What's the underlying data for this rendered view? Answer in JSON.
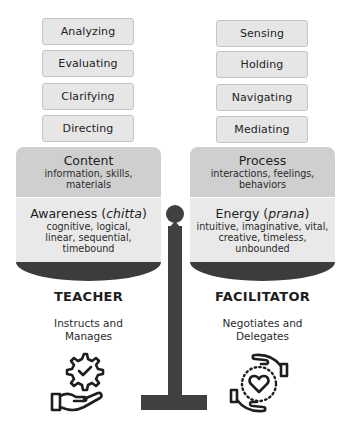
{
  "left": {
    "steps": [
      "Analyzing",
      "Evaluating",
      "Clarifying",
      "Directing"
    ],
    "upper_panel": {
      "title": "Content",
      "desc": "information, skills, materials"
    },
    "lower_panel": {
      "title_main": "Awareness (",
      "title_italic": "chitta",
      "title_end": ")",
      "desc": "cognitive, logical, linear, sequential, timebound"
    },
    "role": {
      "title": "TEACHER",
      "subtitle_line1": "Instructs and",
      "subtitle_line2": "Manages",
      "icon": "hand-gear-check-icon"
    }
  },
  "right": {
    "steps": [
      "Sensing",
      "Holding",
      "Navigating",
      "Mediating"
    ],
    "upper_panel": {
      "title": "Process",
      "desc": "interactions, feelings, behaviors"
    },
    "lower_panel": {
      "title_main": "Energy (",
      "title_italic": "prana",
      "title_end": ")",
      "desc": "intuitive, imaginative, vital, creative, timeless, unbounded"
    },
    "role": {
      "title": "FACILITATOR",
      "subtitle_line1": "Negotiates and",
      "subtitle_line2": "Delegates",
      "icon": "hands-heart-cycle-icon"
    }
  },
  "colors": {
    "step_bg": "#e6e6e6",
    "upper_panel_bg": "#cfcfcf",
    "lower_panel_bg": "#e9e9e9",
    "scale_dark": "#404040"
  }
}
